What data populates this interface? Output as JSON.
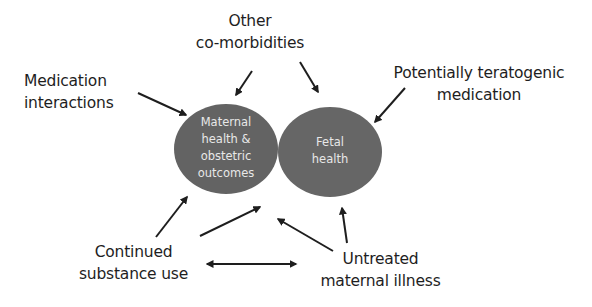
{
  "diagram": {
    "circles": [
      {
        "id": "maternal",
        "lines": [
          "Maternal",
          "health &",
          "obstetric",
          "outcomes"
        ],
        "color": "#636363"
      },
      {
        "id": "fetal",
        "lines": [
          "Fetal",
          "health"
        ],
        "color": "#666666"
      }
    ],
    "factors": {
      "other": [
        "Other",
        "co-morbidities"
      ],
      "medication_interactions": [
        "Medication",
        "interactions"
      ],
      "teratogenic": [
        "Potentially teratogenic",
        "medication"
      ],
      "substance": [
        "Continued",
        "substance use"
      ],
      "untreated": [
        "Untreated",
        "maternal illness"
      ]
    },
    "arrows": [
      {
        "from": "medication_interactions",
        "to": "maternal"
      },
      {
        "from": "other",
        "to": "maternal"
      },
      {
        "from": "other",
        "to": "fetal"
      },
      {
        "from": "teratogenic",
        "to": "fetal"
      },
      {
        "from": "substance",
        "to": "maternal"
      },
      {
        "from": "substance",
        "to": "between-circles"
      },
      {
        "from": "untreated",
        "to": "between-circles"
      },
      {
        "from": "untreated",
        "to": "fetal"
      },
      {
        "from": "substance",
        "to": "untreated",
        "bidirectional": true
      }
    ]
  }
}
